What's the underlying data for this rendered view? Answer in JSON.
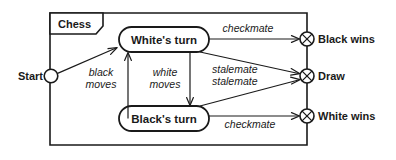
{
  "diagram": {
    "title": "Chess",
    "type": "uml-state-diagram",
    "colors": {
      "stroke": "#1a1a1a",
      "background": "#ffffff"
    },
    "frame_label": "Chess",
    "start_label": "Start",
    "states": [
      {
        "id": "white-turn",
        "label": "White's turn"
      },
      {
        "id": "black-turn",
        "label": "Black's turn"
      }
    ],
    "terminals": [
      {
        "id": "black-wins",
        "label": "Black wins"
      },
      {
        "id": "draw",
        "label": "Draw"
      },
      {
        "id": "white-wins",
        "label": "White wins"
      }
    ],
    "transitions": [
      {
        "id": "start-to-white",
        "from": "start",
        "to": "white-turn",
        "label": ""
      },
      {
        "id": "white-to-black-wins",
        "from": "white-turn",
        "to": "black-wins",
        "label": "checkmate"
      },
      {
        "id": "white-to-draw",
        "from": "white-turn",
        "to": "draw",
        "label": "stalemate"
      },
      {
        "id": "black-to-draw",
        "from": "black-turn",
        "to": "draw",
        "label": "stalemate"
      },
      {
        "id": "black-to-white-wins",
        "from": "black-turn",
        "to": "white-wins",
        "label": "checkmate"
      },
      {
        "id": "white-to-black",
        "from": "white-turn",
        "to": "black-turn",
        "label_line1": "white",
        "label_line2": "moves"
      },
      {
        "id": "black-to-white",
        "from": "black-turn",
        "to": "white-turn",
        "label_line1": "black",
        "label_line2": "moves"
      }
    ],
    "edge_labels": {
      "checkmate_top": "checkmate",
      "checkmate_bottom": "checkmate",
      "stalemate_upper": "stalemate",
      "stalemate_lower": "stalemate",
      "black_moves_l1": "black",
      "black_moves_l2": "moves",
      "white_moves_l1": "white",
      "white_moves_l2": "moves"
    }
  }
}
